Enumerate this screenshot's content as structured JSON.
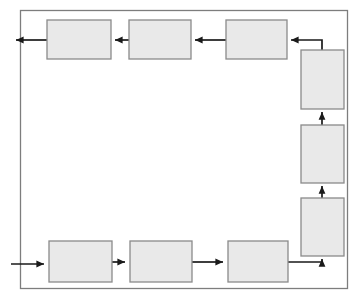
{
  "diagram": {
    "kind": "closed-loop-block-flow-diagram",
    "title": "",
    "canvas": {
      "width": 358,
      "height": 299,
      "background": "#ffffff"
    },
    "style": {
      "block_fill": "#e9e9e9",
      "block_stroke": "#8a8a8a",
      "line_color": "#1a1a1a",
      "frame_stroke": "#7d7d7d"
    },
    "frame": {
      "x": 20,
      "y": 10,
      "width": 327,
      "height": 278,
      "label": ""
    },
    "blocks": [
      {
        "id": "top-1",
        "label": "",
        "x": 47,
        "y": 20,
        "width": 64,
        "height": 39,
        "row": "top",
        "index": 1
      },
      {
        "id": "top-2",
        "label": "",
        "x": 129,
        "y": 20,
        "width": 62,
        "height": 39,
        "row": "top",
        "index": 2
      },
      {
        "id": "top-3",
        "label": "",
        "x": 226,
        "y": 20,
        "width": 61,
        "height": 39,
        "row": "top",
        "index": 3
      },
      {
        "id": "right-1",
        "label": "",
        "x": 301,
        "y": 50,
        "width": 43,
        "height": 59,
        "row": "right",
        "index": 1
      },
      {
        "id": "right-2",
        "label": "",
        "x": 301,
        "y": 125,
        "width": 43,
        "height": 58,
        "row": "right",
        "index": 2
      },
      {
        "id": "right-3",
        "label": "",
        "x": 301,
        "y": 198,
        "width": 43,
        "height": 58,
        "row": "right",
        "index": 3
      },
      {
        "id": "bottom-1",
        "label": "",
        "x": 49,
        "y": 241,
        "width": 63,
        "height": 41,
        "row": "bottom",
        "index": 1
      },
      {
        "id": "bottom-2",
        "label": "",
        "x": 130,
        "y": 241,
        "width": 62,
        "height": 41,
        "row": "bottom",
        "index": 2
      },
      {
        "id": "bottom-3",
        "label": "",
        "x": 228,
        "y": 241,
        "width": 60,
        "height": 41,
        "row": "bottom",
        "index": 3
      }
    ],
    "connectors": [
      {
        "id": "input-arrow",
        "label": "",
        "from": "external-left",
        "to": "bottom-1",
        "direction": "right",
        "points": "11,264 45,264"
      },
      {
        "id": "bottom-1-to-2",
        "label": "",
        "from": "bottom-1",
        "to": "bottom-2",
        "direction": "right",
        "points": "112,262 126,262"
      },
      {
        "id": "bottom-2-to-3",
        "label": "",
        "from": "bottom-2",
        "to": "bottom-3",
        "direction": "right",
        "points": "192,262 224,262"
      },
      {
        "id": "bottom-3-to-right-3",
        "label": "",
        "from": "bottom-3",
        "to": "right-3",
        "direction": "up",
        "points": "288,262 322,262 322,260"
      },
      {
        "id": "right-3-to-right-2",
        "label": "",
        "from": "right-3",
        "to": "right-2",
        "direction": "up",
        "points": "322,198 322,187"
      },
      {
        "id": "right-2-to-right-1",
        "label": "",
        "from": "right-2",
        "to": "right-1",
        "direction": "up",
        "points": "322,125 322,113"
      },
      {
        "id": "right-1-to-top-3",
        "label": "",
        "from": "right-1",
        "to": "top-3",
        "direction": "left",
        "points": "322,50 322,40 291,40"
      },
      {
        "id": "top-3-to-top-2",
        "label": "",
        "from": "top-3",
        "to": "top-2",
        "direction": "left",
        "points": "226,40 195,40"
      },
      {
        "id": "top-2-to-top-1",
        "label": "",
        "from": "top-2",
        "to": "top-1",
        "direction": "left",
        "points": "129,40 115,40"
      },
      {
        "id": "output-arrow",
        "label": "",
        "from": "top-1",
        "to": "external-left",
        "direction": "left",
        "points": "47,40 15,40"
      }
    ],
    "flow_description": {
      "input": "left-bottom",
      "output": "left-top",
      "loop_order": [
        "bottom-1",
        "bottom-2",
        "bottom-3",
        "right-3",
        "right-2",
        "right-1",
        "top-3",
        "top-2",
        "top-1"
      ]
    }
  }
}
